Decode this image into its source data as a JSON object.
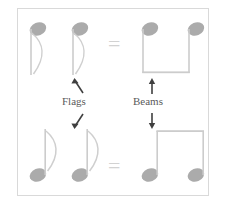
{
  "figure": {
    "background_color": "#ffffff",
    "frame_color": "#d9d9d9",
    "note_color": "#b5b5b5",
    "note_head_color": "#a8a8a8",
    "stem_color": "#c8c8c8",
    "label_color": "#5a5a5a",
    "arrow_color": "#4a4a4a",
    "equals_color": "#d2d2d2"
  },
  "labels": {
    "flags": "Flags",
    "beams": "Beams"
  },
  "rows": [
    {
      "id": "top-row",
      "left_group": {
        "name": "two-flagged-notes-stems-down",
        "note_count": 2,
        "stem_direction": "down",
        "flag": true,
        "beam": false,
        "description": "Two eighth notes with flags, stems down"
      },
      "operator": "=",
      "right_group": {
        "name": "two-beamed-notes-stems-down",
        "note_count": 2,
        "stem_direction": "down",
        "flag": false,
        "beam": true,
        "beam_position": "bottom",
        "description": "Two eighth notes joined by a beam, stems down"
      }
    },
    {
      "id": "bottom-row",
      "left_group": {
        "name": "two-flagged-notes-stems-up",
        "note_count": 2,
        "stem_direction": "up",
        "flag": true,
        "beam": false,
        "description": "Two eighth notes with flags, stems up"
      },
      "operator": "=",
      "right_group": {
        "name": "two-beamed-notes-stems-up",
        "note_count": 2,
        "stem_direction": "up",
        "flag": false,
        "beam": true,
        "beam_position": "top",
        "description": "Two eighth notes joined by a beam, stems up"
      }
    }
  ],
  "operators": {
    "top_equals": "=",
    "bottom_equals": "="
  },
  "annotations": [
    {
      "name": "flags-arrow-up",
      "direction": "up-left",
      "points_to": "top-left-flagged-notes"
    },
    {
      "name": "flags-arrow-down",
      "direction": "down-left",
      "points_to": "bottom-left-flagged-notes"
    },
    {
      "name": "beams-arrow-up",
      "direction": "up",
      "points_to": "top-right-beamed-notes"
    },
    {
      "name": "beams-arrow-down",
      "direction": "down",
      "points_to": "bottom-right-beamed-notes"
    }
  ]
}
